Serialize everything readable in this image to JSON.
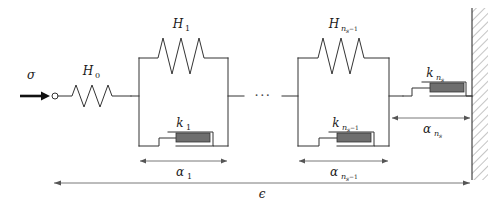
{
  "figure": {
    "type": "mechanical-schematic",
    "width": 502,
    "height": 206,
    "background_color": "#ffffff",
    "line_color": "#333333",
    "dashpot_fill_color": "#6e6e6e",
    "dimension_line_color": "#555555"
  },
  "labels": {
    "stress_arrow": "σ",
    "spring_h0": "H",
    "spring_h0_sub": "0",
    "spring_h1": "H",
    "spring_h1_sub": "1",
    "spring_hn": "H",
    "spring_hn_sub": "n",
    "spring_hn_sub2": "s",
    "spring_hn_sub_tail": "−1",
    "dashpot_k1": "k",
    "dashpot_k1_sub": "1",
    "dashpot_kn1": "k",
    "dashpot_kn1_sub": "n",
    "dashpot_kn1_sub2": "s",
    "dashpot_kn1_sub_tail": "−1",
    "dashpot_kns": "k",
    "dashpot_kns_sub": "n",
    "dashpot_kns_sub2": "s",
    "dim_alpha1": "α",
    "dim_alpha1_sub": "1",
    "dim_alphan1": "α",
    "dim_alphan1_sub": "n",
    "dim_alphan1_sub2": "s",
    "dim_alphan1_sub_tail": "−1",
    "dim_alphans": "α",
    "dim_alphans_sub": "n",
    "dim_alphans_sub2": "s",
    "dim_total_strain": "ϵ",
    "ellipsis": "···"
  },
  "elements": {
    "applied_stress_arrow": "stress-arrow",
    "pin_node": "pin-node",
    "series_spring": "spring-H0",
    "kelvin_unit_1": "kelvin-voigt-unit-1",
    "kelvin_unit_n": "kelvin-voigt-unit-n",
    "terminal_dashpot": "dashpot-kns",
    "fixed_wall": "fixed-wall-hatched"
  }
}
